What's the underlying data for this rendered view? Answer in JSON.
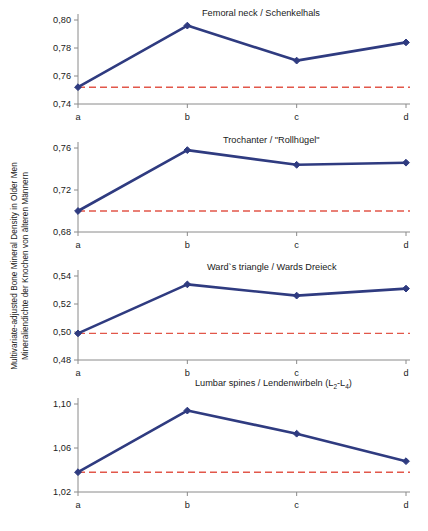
{
  "axis_label": {
    "line_en": "Multivariate-adjusted Bone Mineral Density in Older Men",
    "line_de": "Mineraliendichte der Knochen von älteren Männern"
  },
  "chart_data": {
    "type": "line",
    "title": "",
    "xlabel": "",
    "ylabel": "Multivariate-adjusted Bone Mineral Density in Older Men / Mineraliendichte der Knochen von älteren Männern",
    "grid": false,
    "legend": "none",
    "decimal_separator": ",",
    "categories": [
      "a",
      "b",
      "c",
      "d"
    ],
    "series_color": "#2f3b80",
    "reference_color": "#e2574a",
    "panels": [
      {
        "id": "femoral-neck",
        "title": "Femoral neck / Schenkelhals",
        "ylim": [
          0.74,
          0.8
        ],
        "yticks": [
          0.8,
          0.78,
          0.76,
          0.74
        ],
        "ytick_labels": [
          "0,80",
          "0,78",
          "0,76",
          "0,74"
        ],
        "values": [
          0.752,
          0.796,
          0.771,
          0.784
        ],
        "reference_value": 0.752
      },
      {
        "id": "trochanter",
        "title": "Trochanter / \"Rollhügel\"",
        "ylim": [
          0.68,
          0.76
        ],
        "yticks": [
          0.76,
          0.72,
          0.68
        ],
        "ytick_labels": [
          "0,76",
          "0,72",
          "0,68"
        ],
        "values": [
          0.7,
          0.758,
          0.744,
          0.746
        ],
        "reference_value": 0.7
      },
      {
        "id": "wards-triangle",
        "title": "Ward`s triangle / Wards Dreieck",
        "ylim": [
          0.48,
          0.54
        ],
        "yticks": [
          0.54,
          0.52,
          0.5,
          0.48
        ],
        "ytick_labels": [
          "0,54",
          "0,52",
          "0,50",
          "0,48"
        ],
        "values": [
          0.499,
          0.534,
          0.526,
          0.531
        ],
        "reference_value": 0.499
      },
      {
        "id": "lumbar-spines",
        "title": "Lumbar spines / Lendenwirbeln (L2-L4)",
        "title_html": "Lumbar spines / Lendenwirbeln (L<sub>2</sub>-L<sub>4</sub>)",
        "ylim": [
          1.02,
          1.1
        ],
        "yticks": [
          1.1,
          1.06,
          1.02
        ],
        "ytick_labels": [
          "1,10",
          "1,06",
          "1,02"
        ],
        "values": [
          1.038,
          1.094,
          1.073,
          1.048
        ],
        "reference_value": 1.038
      }
    ]
  },
  "panel_layout": [
    {
      "top": 8,
      "height": 124,
      "title_left": 162,
      "title_top": 8
    },
    {
      "top": 136,
      "height": 124,
      "title_left": 183,
      "title_top": 135
    },
    {
      "top": 264,
      "height": 124,
      "title_left": 167,
      "title_top": 262
    },
    {
      "top": 392,
      "height": 128,
      "title_left": 155,
      "title_top": 378
    }
  ]
}
